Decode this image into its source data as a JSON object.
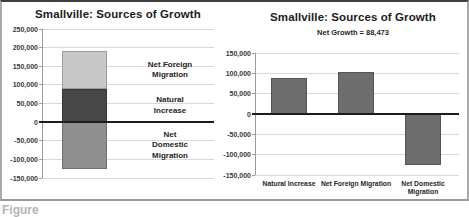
{
  "page": {
    "background": "#ffffff",
    "caption_partial": "Figure"
  },
  "style": {
    "gridline": "#d9d9d9",
    "axis_line": "#9b9b9b",
    "zero_line": "#1c1c1c",
    "tick_color": "#383838",
    "title_color": "#1c1c1c"
  },
  "chart_data": "see charts",
  "charts": [
    {
      "id": "stacked-sources",
      "type": "bar",
      "subtype": "stacked-single-column",
      "title": "Smallville: Sources of Growth",
      "xlabel": "",
      "ylabel": "",
      "axis": {
        "ymin": -150000,
        "ymax": 250000,
        "tick_step": 50000,
        "grid": true,
        "tick_labels": [
          "250,000",
          "200,000",
          "150,000",
          "100,000",
          "50,000",
          "0",
          "-50,000",
          "-100,000",
          "-150,000"
        ]
      },
      "segments": [
        {
          "label": "Natural Increase",
          "label_lines": [
            "Natural",
            "Increase"
          ],
          "value": 88000,
          "color": "#474747"
        },
        {
          "label": "Net Foreign Migration",
          "label_lines": [
            "Net Foreign",
            "Migration"
          ],
          "value": 103000,
          "color": "#c8c8c8"
        },
        {
          "label": "Net Domestic Migration",
          "label_lines": [
            "Net",
            "Domestic",
            "Migration"
          ],
          "value": -125000,
          "color": "#8f8f8f"
        }
      ]
    },
    {
      "id": "net-growth",
      "type": "bar",
      "title": "Smallville: Sources of Growth",
      "subtitle": "Net Growth = 88,473",
      "xlabel": "",
      "ylabel": "",
      "axis": {
        "ymin": -150000,
        "ymax": 150000,
        "tick_step": 50000,
        "grid": true,
        "tick_labels": [
          "150,000",
          "100,000",
          "50,000",
          "0",
          "-50,000",
          "-100,000",
          "-150,000"
        ]
      },
      "categories": [
        "Natural Increase",
        "Net Foreign Migration",
        "Net Domestic Migration"
      ],
      "category_label_lines": [
        [
          "Natural Increase"
        ],
        [
          "Net Foreign Migration"
        ],
        [
          "Net Domestic",
          "Migration"
        ]
      ],
      "values": [
        88000,
        103000,
        -125000
      ],
      "bar_color": "#6e6e6e"
    }
  ]
}
